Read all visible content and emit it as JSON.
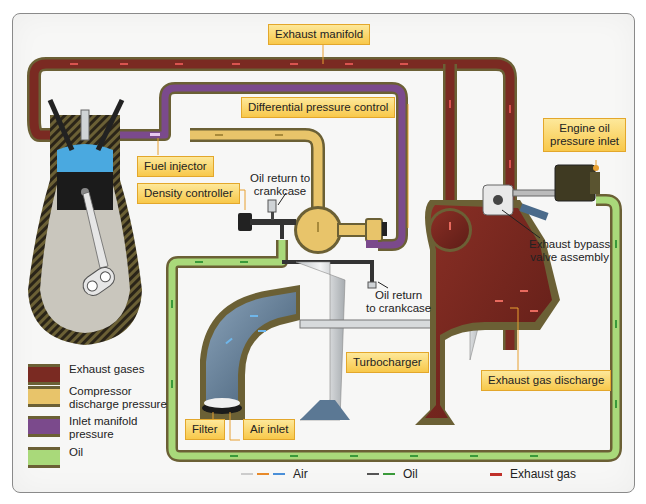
{
  "callouts": {
    "exhaust_manifold": "Exhaust manifold",
    "differential_pressure_control": "Differential pressure control",
    "fuel_injector": "Fuel injector",
    "density_controller": "Density controller",
    "engine_oil_pressure_inlet": "Engine oil\npressure inlet",
    "turbocharger": "Turbocharger",
    "exhaust_gas_discharge": "Exhaust gas discharge",
    "filter": "Filter",
    "air_inlet": "Air inlet"
  },
  "notes": {
    "oil_return_top": "Oil return to\ncrankcase",
    "oil_return_bottom": "Oil return\nto crankcase",
    "exhaust_bypass_valve": "Exhaust bypass\nvalve assembly"
  },
  "legend": [
    {
      "label": "Exhaust gases",
      "color": "#7a2a22"
    },
    {
      "label": "Compressor\ndischarge pressure",
      "color": "#e8c46a"
    },
    {
      "label": "Inlet manifold\npressure",
      "color": "#7b4a8c"
    },
    {
      "label": "Oil",
      "color": "#a9d97a"
    }
  ],
  "flow_legend": [
    {
      "label": "Air",
      "colors": [
        "#cccccc",
        "#e88a2a",
        "#4a8fd8"
      ]
    },
    {
      "label": "Oil",
      "colors": [
        "#555555",
        "#3a9a3a"
      ]
    },
    {
      "label": "Exhaust gas",
      "colors": [
        "#c0302a"
      ]
    }
  ],
  "colors": {
    "exhaust": "#7a2a22",
    "compressor": "#e8c46a",
    "inlet_manifold": "#7b4a8c",
    "oil": "#a9d97a",
    "pipe_border": "#6b6035",
    "callout_fill": "#f8cf5a",
    "callout_border": "#e3a72b",
    "air_duct": "#5b7894"
  }
}
